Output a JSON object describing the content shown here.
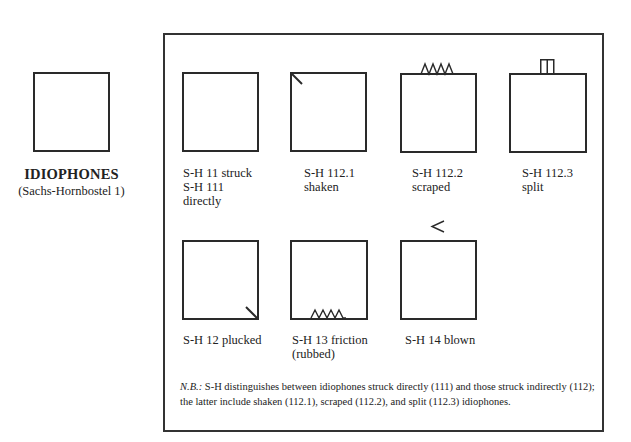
{
  "category": {
    "title": "IDIOPHONES",
    "subtitle": "(Sachs-Hornbostel 1)"
  },
  "types": [
    {
      "id": "struck",
      "lines": [
        "S-H 11 struck",
        "S-H 111",
        "directly"
      ],
      "mark": "none"
    },
    {
      "id": "shaken",
      "lines": [
        "S-H 112.1",
        "shaken"
      ],
      "mark": "diagonal-top-left"
    },
    {
      "id": "scraped",
      "lines": [
        "S-H 112.2",
        "scraped"
      ],
      "mark": "zigzag-top"
    },
    {
      "id": "split",
      "lines": [
        "S-H 112.3",
        "split"
      ],
      "mark": "split-tab-top"
    },
    {
      "id": "plucked",
      "lines": [
        "S-H 12 plucked"
      ],
      "mark": "diagonal-bottom-right"
    },
    {
      "id": "friction",
      "lines": [
        "S-H 13 friction",
        "(rubbed)"
      ],
      "mark": "zigzag-bottom"
    },
    {
      "id": "blown",
      "lines": [
        "S-H 14 blown"
      ],
      "mark": "chevron-above"
    }
  ],
  "note": {
    "prefix": "N.B.:",
    "text": " S-H distinguishes between idiophones struck directly (111) and those struck indirectly (112); the latter include shaken (112.1), scraped (112.2), and split (112.3) idiophones."
  },
  "colors": {
    "line": "#2a2a2a",
    "background": "#ffffff"
  }
}
